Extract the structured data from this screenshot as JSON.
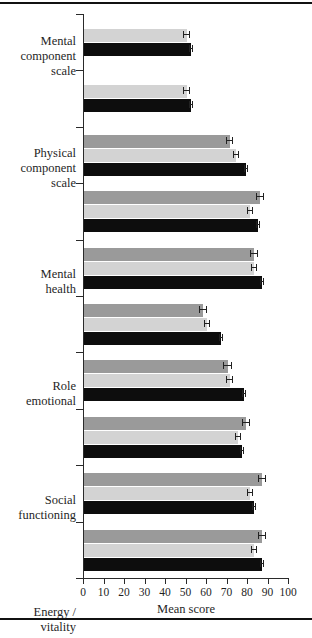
{
  "chart_data": {
    "type": "bar",
    "orientation": "horizontal",
    "title": "",
    "xlabel": "Mean score",
    "ylabel": "",
    "xlim": [
      0,
      100
    ],
    "xticks": [
      0,
      10,
      20,
      30,
      40,
      50,
      60,
      70,
      80,
      90,
      100
    ],
    "grid": false,
    "legend": "none",
    "categories": [
      "Mental component scale",
      "Physical component scale",
      "Mental health",
      "Role emotional",
      "Social functioning",
      "Energy / vitality",
      "General health perceptions",
      "Bodily pain",
      "Role physical",
      "Physical functioning"
    ],
    "category_lines": [
      [
        "Mental",
        "component",
        "scale"
      ],
      [
        "Physical",
        "component",
        "scale"
      ],
      [
        "Mental",
        "health"
      ],
      [
        "Role",
        "emotional"
      ],
      [
        "Social",
        "functioning"
      ],
      [
        "Energy /",
        "vitality"
      ],
      [
        "General",
        "health",
        "perceptions"
      ],
      [
        "Bodily",
        "pain"
      ],
      [
        "Role",
        "physical"
      ],
      [
        "Physical",
        "functioning"
      ]
    ],
    "series": [
      {
        "name": "series-1",
        "color": "#9a9a9a",
        "values": [
          null,
          null,
          71,
          86,
          83,
          58,
          70,
          79,
          87,
          87
        ],
        "errors": [
          null,
          null,
          1.5,
          2.0,
          2.0,
          2.0,
          2.0,
          2.0,
          2.0,
          2.0
        ]
      },
      {
        "name": "series-2",
        "color": "#d3d3d3",
        "values": [
          50,
          50,
          74,
          81,
          83,
          60,
          71,
          75,
          81,
          83
        ],
        "errors": [
          1.5,
          1.5,
          1.5,
          1.5,
          1.5,
          1.5,
          1.5,
          1.5,
          1.5,
          1.5
        ]
      },
      {
        "name": "series-3",
        "color": "#0d0d0d",
        "values": [
          52,
          52,
          79,
          85,
          87,
          67,
          78,
          77,
          83,
          87
        ],
        "errors": [
          1.0,
          1.0,
          1.0,
          1.0,
          1.0,
          1.0,
          1.0,
          1.0,
          1.0,
          1.0
        ]
      }
    ]
  }
}
